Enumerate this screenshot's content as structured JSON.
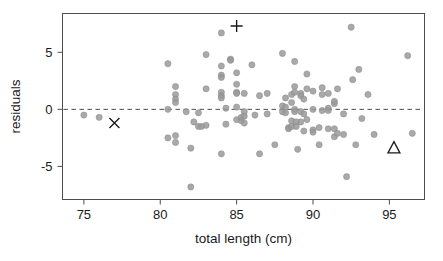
{
  "chart_data": {
    "type": "scatter",
    "title": "",
    "xlabel": "total length (cm)",
    "ylabel": "residuals",
    "xlim": [
      73.6,
      97.3
    ],
    "ylim": [
      -7.9,
      8.4
    ],
    "xticks": [
      75,
      80,
      85,
      90,
      95
    ],
    "yticks": [
      -5,
      0,
      5
    ],
    "xtick_labels": [
      "75",
      "80",
      "85",
      "90",
      "95"
    ],
    "ytick_labels": [
      "-5",
      "0",
      "5"
    ],
    "grid": false,
    "legend": "none",
    "reference_line": {
      "type": "horizontal-dashed",
      "y": 0,
      "color": "#4d4d4d"
    },
    "point_color": "#9a9a9a",
    "point_edge_color": "#8a8a8a",
    "point_radius": 3.1,
    "point_opacity": 0.85,
    "series": [
      {
        "name": "residuals",
        "marker": "circle",
        "points": [
          [
            75.0,
            -0.5
          ],
          [
            76.0,
            -0.7
          ],
          [
            80.5,
            4.0
          ],
          [
            80.5,
            0.0
          ],
          [
            80.5,
            -2.5
          ],
          [
            81.0,
            2.0
          ],
          [
            81.0,
            1.3
          ],
          [
            81.0,
            0.9
          ],
          [
            81.0,
            0.6
          ],
          [
            81.0,
            -2.3
          ],
          [
            81.0,
            -2.9
          ],
          [
            81.7,
            -0.2
          ],
          [
            82.0,
            -6.8
          ],
          [
            82.0,
            -3.4
          ],
          [
            82.2,
            -1.1
          ],
          [
            82.5,
            -0.3
          ],
          [
            82.5,
            -1.5
          ],
          [
            82.7,
            -1.5
          ],
          [
            83.0,
            4.8
          ],
          [
            83.0,
            1.8
          ],
          [
            83.0,
            -1.4
          ],
          [
            84.0,
            6.7
          ],
          [
            84.0,
            3.8
          ],
          [
            84.0,
            3.0
          ],
          [
            84.0,
            2.8
          ],
          [
            84.0,
            1.5
          ],
          [
            84.0,
            1.2
          ],
          [
            84.0,
            1.0
          ],
          [
            84.0,
            -3.9
          ],
          [
            84.3,
            0.1
          ],
          [
            84.3,
            -1.3
          ],
          [
            84.6,
            4.4
          ],
          [
            84.6,
            4.3
          ],
          [
            85.0,
            3.2
          ],
          [
            85.0,
            2.2
          ],
          [
            85.0,
            1.5
          ],
          [
            85.0,
            1.4
          ],
          [
            85.0,
            0.2
          ],
          [
            85.0,
            -0.9
          ],
          [
            85.3,
            -0.7
          ],
          [
            85.3,
            -1.0
          ],
          [
            85.5,
            1.4
          ],
          [
            85.5,
            -0.2
          ],
          [
            85.5,
            -0.6
          ],
          [
            85.5,
            -1.2
          ],
          [
            86.0,
            3.9
          ],
          [
            86.2,
            -0.5
          ],
          [
            86.5,
            1.2
          ],
          [
            86.5,
            -3.9
          ],
          [
            87.0,
            1.4
          ],
          [
            87.0,
            -0.4
          ],
          [
            87.5,
            -3.1
          ],
          [
            88.0,
            4.9
          ],
          [
            88.0,
            -0.2
          ],
          [
            88.0,
            0.3
          ],
          [
            88.2,
            1.0
          ],
          [
            88.2,
            0.2
          ],
          [
            88.2,
            -0.3
          ],
          [
            88.4,
            -1.6
          ],
          [
            88.4,
            -1.7
          ],
          [
            88.6,
            1.3
          ],
          [
            88.6,
            0.6
          ],
          [
            88.6,
            -1.0
          ],
          [
            88.6,
            -1.5
          ],
          [
            88.8,
            4.2
          ],
          [
            88.8,
            2.0
          ],
          [
            88.8,
            1.5
          ],
          [
            88.8,
            0.0
          ],
          [
            88.8,
            -0.2
          ],
          [
            88.9,
            -1.1
          ],
          [
            88.9,
            -1.5
          ],
          [
            89.0,
            -3.5
          ],
          [
            89.2,
            1.4
          ],
          [
            89.2,
            1.2
          ],
          [
            89.2,
            -0.2
          ],
          [
            89.2,
            -1.1
          ],
          [
            89.4,
            0.9
          ],
          [
            89.4,
            -0.4
          ],
          [
            89.4,
            -1.9
          ],
          [
            89.6,
            3.1
          ],
          [
            89.6,
            1.8
          ],
          [
            89.6,
            -0.9
          ],
          [
            90.0,
            1.6
          ],
          [
            90.0,
            0.0
          ],
          [
            90.0,
            -1.8
          ],
          [
            90.0,
            -2.0
          ],
          [
            90.4,
            -1.6
          ],
          [
            90.4,
            -3.1
          ],
          [
            90.6,
            1.9
          ],
          [
            90.6,
            1.3
          ],
          [
            90.6,
            -0.1
          ],
          [
            91.0,
            1.4
          ],
          [
            91.0,
            0.1
          ],
          [
            91.0,
            -0.1
          ],
          [
            91.0,
            -1.7
          ],
          [
            91.4,
            0.5
          ],
          [
            91.4,
            0.7
          ],
          [
            91.4,
            -1.7
          ],
          [
            91.4,
            -2.4
          ],
          [
            91.6,
            1.8
          ],
          [
            91.6,
            -2.1
          ],
          [
            92.0,
            -0.4
          ],
          [
            92.0,
            -2.2
          ],
          [
            92.2,
            -5.9
          ],
          [
            92.5,
            7.2
          ],
          [
            92.6,
            2.6
          ],
          [
            92.8,
            -3.1
          ],
          [
            93.0,
            3.5
          ],
          [
            93.2,
            -0.8
          ],
          [
            93.6,
            1.3
          ],
          [
            94.0,
            -2.2
          ],
          [
            96.2,
            4.7
          ],
          [
            96.5,
            -2.1
          ]
        ]
      },
      {
        "name": "marker-cross",
        "marker": "plus",
        "points": [
          [
            85.0,
            7.3
          ]
        ]
      },
      {
        "name": "marker-x",
        "marker": "x",
        "points": [
          [
            77.0,
            -1.2
          ]
        ]
      },
      {
        "name": "marker-triangle",
        "marker": "triangle",
        "points": [
          [
            95.3,
            -3.4
          ]
        ]
      }
    ]
  },
  "axes": {
    "frame_color": "#4d4d4d",
    "tick_color": "#4d4d4d"
  }
}
